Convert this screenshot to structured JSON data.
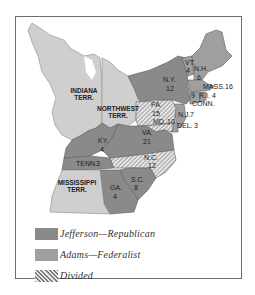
{
  "map": {
    "colors": {
      "jefferson": "#8a8a8a",
      "adams": "#9f9f9f",
      "territory": "#cfcfcf",
      "border": "#6e6e6e",
      "background": "#ffffff"
    },
    "territories": [
      {
        "id": "indiana",
        "label_line1": "INDIANA",
        "label_line2": "TERR."
      },
      {
        "id": "northwest",
        "label_line1": "NORTHWEST",
        "label_line2": "TERR."
      },
      {
        "id": "mississippi",
        "label_line1": "MISSISSIPPI",
        "label_line2": "TERR."
      }
    ],
    "states": [
      {
        "id": "vt",
        "abbr": "VT.",
        "votes": "4",
        "party": "adams"
      },
      {
        "id": "nh",
        "abbr": "N.H.",
        "votes": "6",
        "party": "adams"
      },
      {
        "id": "mass",
        "abbr": "MASS.",
        "votes": "16",
        "party": "adams"
      },
      {
        "id": "ri",
        "abbr": "R.I.",
        "votes": "4",
        "party": "adams"
      },
      {
        "id": "conn",
        "abbr": "CONN.",
        "votes": "9",
        "party": "adams"
      },
      {
        "id": "ny",
        "abbr": "N.Y.",
        "votes": "12",
        "party": "jefferson"
      },
      {
        "id": "nj",
        "abbr": "N.J.",
        "votes": "7",
        "party": "adams"
      },
      {
        "id": "del",
        "abbr": "DEL.",
        "votes": "3",
        "party": "adams"
      },
      {
        "id": "pa",
        "abbr": "PA.",
        "votes": "15",
        "party": "divided"
      },
      {
        "id": "md",
        "abbr": "MD.",
        "votes": "10",
        "party": "divided"
      },
      {
        "id": "va",
        "abbr": "VA.",
        "votes": "21",
        "party": "jefferson"
      },
      {
        "id": "ky",
        "abbr": "KY.",
        "votes": "4",
        "party": "jefferson"
      },
      {
        "id": "tenn",
        "abbr": "TENN.",
        "votes": "3",
        "party": "jefferson"
      },
      {
        "id": "nc",
        "abbr": "N.C.",
        "votes": "12",
        "party": "divided"
      },
      {
        "id": "sc",
        "abbr": "S.C.",
        "votes": "8",
        "party": "jefferson"
      },
      {
        "id": "ga",
        "abbr": "GA.",
        "votes": "4",
        "party": "jefferson"
      }
    ]
  },
  "legend": {
    "items": [
      {
        "id": "jefferson",
        "label": "Jefferson—Republican"
      },
      {
        "id": "adams",
        "label": "Adams—Federalist"
      },
      {
        "id": "divided",
        "label": "Divided"
      }
    ]
  }
}
